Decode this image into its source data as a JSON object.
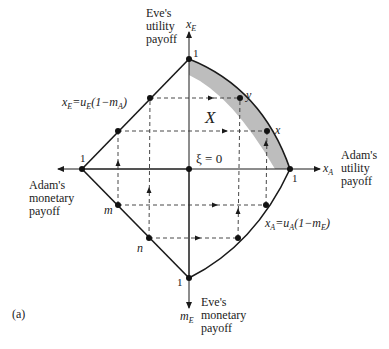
{
  "figure": {
    "panel_label": "(a)",
    "region_label": "X",
    "origin_label": "ξ = 0",
    "colors": {
      "line": "#1a1a1a",
      "shade": "#bdbdbd",
      "dash": "#333333"
    }
  },
  "axes": {
    "top": {
      "var": "x",
      "sub": "E",
      "title_lines": [
        "Eve's",
        "utility",
        "payoff"
      ],
      "tick": "1"
    },
    "right": {
      "var": "x",
      "sub": "A",
      "title_lines": [
        "Adam's",
        "utility",
        "payoff"
      ],
      "tick": "1"
    },
    "left": {
      "title_lines": [
        "Adam's",
        "monetary",
        "payoff"
      ],
      "tick": "1"
    },
    "bottom": {
      "var": "m",
      "sub": "E",
      "title_lines": [
        "Eve's",
        "monetary",
        "payoff"
      ],
      "tick": "1"
    }
  },
  "equations": {
    "eve": {
      "lhs": "x",
      "lhs_sub": "E",
      "eq": "=u",
      "u_sub": "E",
      "paren_open": "(1−m",
      "m_sub": "A",
      "paren_close": ")"
    },
    "adam": {
      "lhs": "x",
      "lhs_sub": "A",
      "eq": "=u",
      "u_sub": "A",
      "paren_open": "(1−m",
      "m_sub": "E",
      "paren_close": ")"
    }
  },
  "points": {
    "x": "x",
    "y": "y",
    "m": "m",
    "n": "n"
  }
}
